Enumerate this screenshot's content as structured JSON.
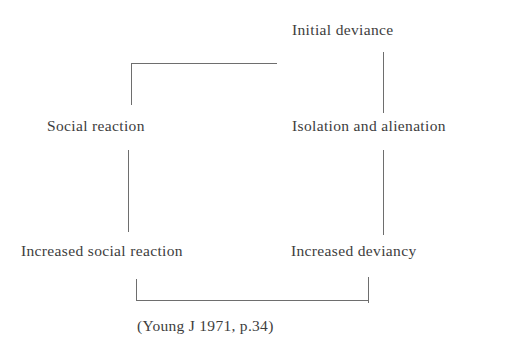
{
  "figure": {
    "type": "cyclic-flow-diagram",
    "background_color": "#ffffff",
    "text_color": "#3d3d3d",
    "line_color": "#6e6e6e"
  },
  "nodes": [
    {
      "id": "initial-deviance",
      "label": "Initial deviance"
    },
    {
      "id": "isolation",
      "label": "Isolation and alienation"
    },
    {
      "id": "increased-deviancy",
      "label": "Increased deviancy"
    },
    {
      "id": "increased-social",
      "label": "Increased social reaction"
    },
    {
      "id": "social-reaction",
      "label": "Social reaction"
    }
  ],
  "citation": {
    "text": "(Young J 1971, p.34)"
  },
  "connectors": [
    {
      "id": "top-horizontal",
      "orientation": "horizontal",
      "from": "social-reaction-top",
      "to": "initial-deviance-left"
    },
    {
      "id": "top-left-vertical",
      "orientation": "vertical",
      "from": "top-horizontal",
      "to": "social-reaction"
    },
    {
      "id": "right-upper",
      "orientation": "vertical",
      "from": "initial-deviance",
      "to": "isolation"
    },
    {
      "id": "left-middle",
      "orientation": "vertical",
      "from": "social-reaction",
      "to": "increased-social"
    },
    {
      "id": "right-middle",
      "orientation": "vertical",
      "from": "isolation",
      "to": "increased-deviancy"
    },
    {
      "id": "bottom-left-vertical",
      "orientation": "vertical",
      "from": "increased-social",
      "to": "bottom-horizontal"
    },
    {
      "id": "bottom-horizontal",
      "orientation": "horizontal",
      "from": "bottom-left-vertical",
      "to": "bottom-right-vertical"
    },
    {
      "id": "bottom-right-vertical",
      "orientation": "vertical",
      "from": "bottom-horizontal",
      "to": "increased-deviancy"
    }
  ]
}
